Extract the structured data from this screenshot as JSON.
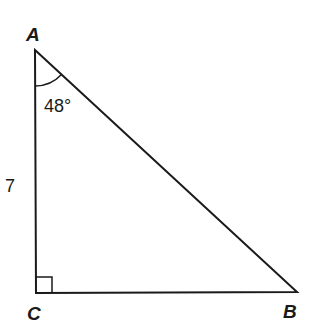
{
  "diagram": {
    "type": "right-triangle",
    "vertices": {
      "A": {
        "label": "A",
        "x": 35,
        "y": 50
      },
      "B": {
        "label": "B",
        "x": 297,
        "y": 292
      },
      "C": {
        "label": "C",
        "x": 36,
        "y": 293
      }
    },
    "angle_label": "48°",
    "side_label": "7",
    "right_angle_at": "C",
    "stroke_color": "#1a1a1a"
  }
}
